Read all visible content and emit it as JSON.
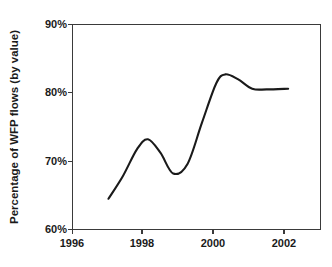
{
  "chart_data": {
    "type": "line",
    "title": "",
    "xlabel": "",
    "ylabel": "Percentage of WFP flows (by value)",
    "xlim": [
      1996,
      2002.9
    ],
    "ylim": [
      60,
      90
    ],
    "grid": false,
    "legend": "none",
    "x_ticks": [
      "1996",
      "1998",
      "2000",
      "2002"
    ],
    "x_tick_values": [
      1996,
      1998,
      2000,
      2002
    ],
    "x_minor_ticks": [
      1997,
      1999,
      2001
    ],
    "y_ticks": [
      "60%",
      "70%",
      "80%",
      "90%"
    ],
    "y_tick_values": [
      60,
      70,
      80,
      90
    ],
    "series": [
      {
        "name": "Percentage of WFP flows (by value)",
        "color": "#1a1a1a",
        "x": [
          1997.0,
          1997.4,
          1997.8,
          1998.1,
          1998.45,
          1998.8,
          1999.2,
          1999.6,
          2000.0,
          2000.25,
          2000.6,
          2001.0,
          2001.4,
          2002.0
        ],
        "values": [
          64.5,
          67.8,
          71.8,
          73.2,
          71.2,
          68.2,
          69.6,
          75.6,
          81.4,
          82.7,
          82.0,
          80.6,
          80.5,
          80.6
        ]
      }
    ],
    "annotations": []
  },
  "figure": {
    "background_color": "#ffffff",
    "axis_color": "#3a3a3a",
    "line_color": "#1a1a1a"
  }
}
